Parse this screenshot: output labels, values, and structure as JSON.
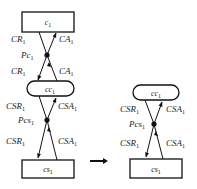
{
  "left_diagram": {
    "top_node": {
      "name": "c",
      "sub": "1",
      "shape": "rectangle"
    },
    "middle_node": {
      "name": "cc",
      "sub": "1",
      "shape": "rounded"
    },
    "bottom_node": {
      "name": "cs",
      "sub": "1",
      "shape": "rectangle"
    },
    "upper_crossing": {
      "point": {
        "name": "Pc",
        "sub": "1"
      },
      "upper_left": {
        "name": "CR",
        "sub": "1"
      },
      "upper_right": {
        "name": "CA",
        "sub": "1"
      },
      "lower_left": {
        "name": "CR",
        "sub": "1"
      },
      "lower_right": {
        "name": "CA",
        "sub": "1"
      }
    },
    "lower_crossing": {
      "point": {
        "name": "Pcs",
        "sub": "1"
      },
      "upper_left": {
        "name": "CSR",
        "sub": "1"
      },
      "upper_right": {
        "name": "CSA",
        "sub": "1"
      },
      "lower_left": {
        "name": "CSR",
        "sub": "1"
      },
      "lower_right": {
        "name": "CSA",
        "sub": "1"
      }
    }
  },
  "transform_arrow": {
    "direction": "right"
  },
  "right_diagram": {
    "top_node": {
      "name": "cc",
      "sub": "1",
      "shape": "rounded"
    },
    "bottom_node": {
      "name": "cs",
      "sub": "1",
      "shape": "rectangle"
    },
    "crossing": {
      "point": {
        "name": "Pcs",
        "sub": "1"
      },
      "upper_left": {
        "name": "CSR",
        "sub": "1"
      },
      "upper_right": {
        "name": "CSA",
        "sub": "1"
      },
      "lower_left": {
        "name": "CSR",
        "sub": "1"
      },
      "lower_right": {
        "name": "CSA",
        "sub": "1"
      }
    }
  },
  "colors": {
    "stroke": "#111111",
    "background": "#ffffff"
  }
}
